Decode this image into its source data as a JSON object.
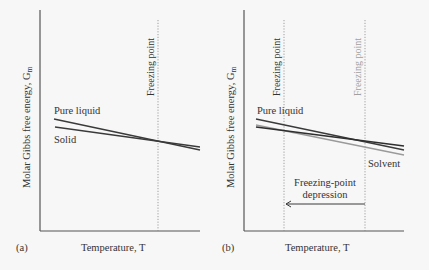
{
  "panels": [
    {
      "id": "a",
      "panel_label": "(a)",
      "xlabel": "Temperature, T",
      "ylabel": "Molar Gibbs free energy, G",
      "ylabel_sub": "m",
      "freezing_label": "Freezing point",
      "curve_labels": {
        "liquid": "Pure liquid",
        "solid": "Solid"
      }
    },
    {
      "id": "b",
      "panel_label": "(b)",
      "xlabel": "Temperature, T",
      "ylabel": "Molar Gibbs free energy, G",
      "ylabel_sub": "m",
      "freezing_label_solution": "Freezing point",
      "freezing_label_pure": "Freezing point",
      "curve_labels": {
        "liquid": "Pure liquid",
        "solvent": "Solvent"
      },
      "annotation_line1": "Freezing-point",
      "annotation_line2": "depression"
    }
  ],
  "colors": {
    "background": "#f7f7f7",
    "axis": "#444444",
    "line_dark": "#3a3a3a",
    "line_gray": "#9a9a9a",
    "text_gray": "#a0a0a0"
  }
}
